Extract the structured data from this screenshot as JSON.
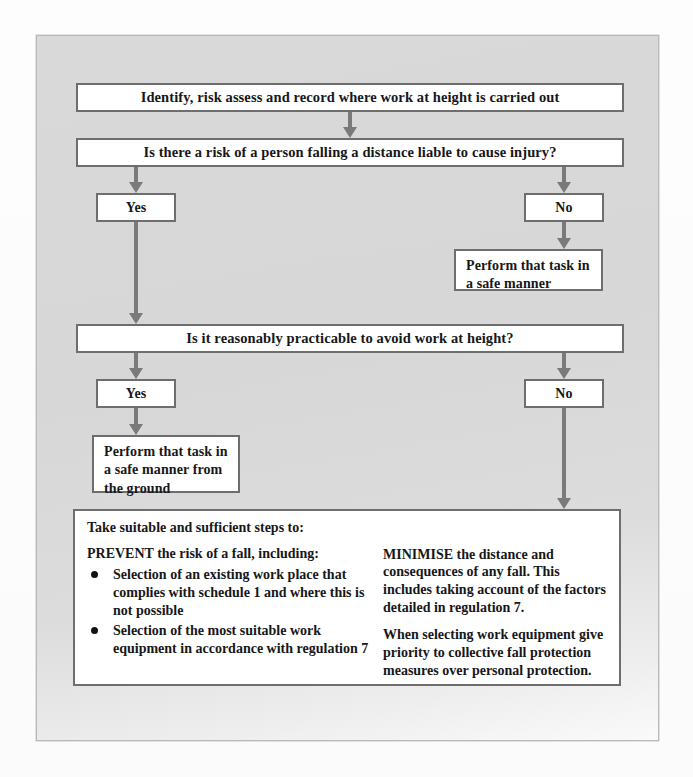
{
  "diagram": {
    "colors": {
      "page_background": "#fdfdfd",
      "frame_background": "#d8d8d8",
      "box_border": "#6e6e6e",
      "box_fill": "#ffffff",
      "arrow": "#7a7a7a",
      "text": "#17171a"
    },
    "nodes": {
      "identify": "Identify, risk assess and record where work at height is carried out",
      "risk_question": "Is there a risk of a person falling a distance liable to cause injury?",
      "risk_yes": "Yes",
      "risk_no": "No",
      "perform_safe": "Perform that task in a safe manner",
      "practicable_question": "Is it reasonably practicable to avoid work at height?",
      "practicable_yes": "Yes",
      "practicable_no": "No",
      "perform_safe_ground": "Perform that task in a safe manner from the ground"
    },
    "outcome_box": {
      "heading": "Take suitable and sufficient steps to:",
      "left_intro": "PREVENT the risk of a fall, including:",
      "left_bullets": [
        "Selection of an existing work place that complies with schedule 1 and where this is not possible",
        "Selection of the most suitable work equipment in accordance with regulation 7"
      ],
      "right_paragraphs": [
        "MINIMISE the distance and consequences of any fall. This includes taking account of the factors detailed in regulation 7.",
        "When selecting work equipment give priority to collective fall protection measures over personal protection."
      ]
    },
    "connectors": [
      {
        "name": "identify-to-risk-question"
      },
      {
        "name": "risk-question-to-yes"
      },
      {
        "name": "risk-question-to-no"
      },
      {
        "name": "risk-no-to-perform-safe"
      },
      {
        "name": "risk-yes-to-practicable-question"
      },
      {
        "name": "practicable-question-to-yes"
      },
      {
        "name": "practicable-question-to-no"
      },
      {
        "name": "practicable-yes-to-perform-safe-ground"
      },
      {
        "name": "practicable-no-to-outcome-box"
      }
    ]
  }
}
